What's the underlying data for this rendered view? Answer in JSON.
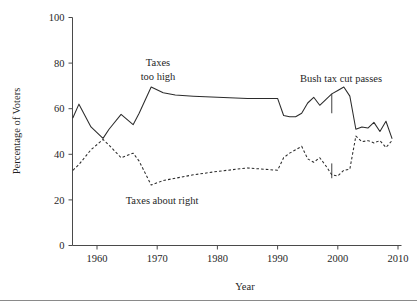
{
  "figure": {
    "background_color": "#ffffff",
    "line_color": "#2b2b2b",
    "axis_color": "#4a4a4a",
    "has_footer_rule": true
  },
  "labels": {
    "ylabel": "Percentage of Voters",
    "xlabel": "Year",
    "yticks": [
      "0",
      "20",
      "40",
      "60",
      "80",
      "100"
    ],
    "xticks": [
      "1960",
      "1970",
      "1980",
      "1990",
      "2000",
      "2010"
    ],
    "annotation_taxes_too_high_line1": "Taxes",
    "annotation_taxes_too_high_line2": "too high",
    "annotation_taxes_about_right": "Taxes about right",
    "annotation_bush": "Bush tax cut passes"
  },
  "chart_data": {
    "type": "line",
    "title": "",
    "xlabel": "Year",
    "ylabel": "Percentage of Voters",
    "xlim": [
      1955,
      2010
    ],
    "ylim": [
      0,
      100
    ],
    "yticks": [
      0,
      20,
      40,
      60,
      80,
      100
    ],
    "xticks": [
      1960,
      1970,
      1980,
      1990,
      2000,
      2010
    ],
    "grid": false,
    "legend": "inline annotations",
    "annotations": [
      {
        "text": "Taxes\ntoo high",
        "x": 1966.5,
        "y": 80,
        "series": "Taxes too high"
      },
      {
        "text": "Taxes about right",
        "x": 1968.0,
        "y": 20,
        "series": "Taxes about right"
      },
      {
        "text": "Bush tax cut passes",
        "x": 2001.5,
        "y": 74,
        "series": "marker"
      }
    ],
    "marker_lines": [
      {
        "label": "Bush tax cut passes",
        "x": 1999.0,
        "series": "Taxes too high",
        "y_top": 66.5,
        "y_bottom": 58.0
      },
      {
        "label": "Bush tax cut passes",
        "x": 1999.0,
        "series": "Taxes about right",
        "y_top": 36.0,
        "y_bottom": 29.5
      }
    ],
    "series": [
      {
        "name": "Taxes too high",
        "style": "solid",
        "x": [
          1956,
          1957,
          1959,
          1961,
          1962,
          1964,
          1966,
          1967,
          1969,
          1971,
          1973,
          1976,
          1980,
          1985,
          1990,
          1991,
          1992,
          1993,
          1994,
          1995,
          1996,
          1997,
          1998,
          1999,
          2000,
          2001,
          2002,
          2003,
          2004,
          2005,
          2006,
          2007,
          2008,
          2009
        ],
        "values": [
          56,
          62,
          52,
          47,
          51,
          57.5,
          53,
          58,
          69.5,
          67,
          66,
          65.5,
          65,
          64.5,
          64.5,
          57,
          56.5,
          56.5,
          58,
          62.5,
          65,
          61.5,
          64,
          66.5,
          68,
          69.5,
          65.5,
          51,
          52,
          51.5,
          54,
          50,
          54.5,
          47
        ]
      },
      {
        "name": "Taxes about right",
        "style": "dashed",
        "x": [
          1956,
          1957,
          1959,
          1961,
          1962,
          1964,
          1966,
          1967,
          1969,
          1971,
          1973,
          1976,
          1980,
          1985,
          1990,
          1991,
          1992,
          1993,
          1994,
          1995,
          1996,
          1997,
          1998,
          1999,
          2000,
          2001,
          2002,
          2003,
          2004,
          2005,
          2006,
          2007,
          2008,
          2009
        ],
        "values": [
          33,
          35.5,
          42,
          46.5,
          44,
          38.5,
          40.5,
          37,
          26.5,
          28.5,
          29.5,
          31,
          32.5,
          34,
          33,
          38.5,
          40.5,
          42,
          43.5,
          38,
          36.5,
          38.5,
          35,
          31,
          30.5,
          33,
          33.5,
          48,
          45.5,
          46,
          45,
          46,
          43,
          46
        ]
      }
    ]
  }
}
